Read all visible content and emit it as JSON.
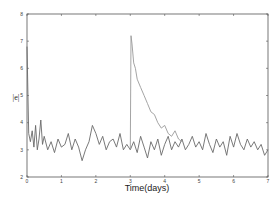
{
  "chart_data": {
    "type": "line",
    "title": "",
    "xlabel": "Time(days)",
    "ylabel": "|e|",
    "xlim": [
      0,
      7
    ],
    "ylim": [
      2,
      8
    ],
    "xticks": [
      0,
      1,
      2,
      3,
      4,
      5,
      6,
      7
    ],
    "yticks": [
      2,
      3,
      4,
      5,
      6,
      7,
      8
    ],
    "grid": false,
    "legend": null,
    "colors": {
      "line": "#6a6a6a",
      "spike": "#9a9a9a",
      "axis": "#555555"
    },
    "series": [
      {
        "name": "baseline noise",
        "description": "noisy signal fluctuating around |e|≈3.2 across 0–7 days, initial spike near 6.8 at t≈0",
        "x": [
          0.0,
          0.05,
          0.1,
          0.15,
          0.2,
          0.25,
          0.3,
          0.35,
          0.4,
          0.45,
          0.5,
          0.6,
          0.7,
          0.8,
          0.9,
          1.0,
          1.1,
          1.2,
          1.3,
          1.4,
          1.5,
          1.6,
          1.7,
          1.8,
          1.9,
          2.0,
          2.1,
          2.2,
          2.3,
          2.4,
          2.5,
          2.6,
          2.7,
          2.8,
          2.9,
          3.0,
          3.1,
          3.2,
          3.3,
          3.4,
          3.5,
          3.6,
          3.7,
          3.8,
          3.9,
          4.0,
          4.1,
          4.2,
          4.3,
          4.4,
          4.5,
          4.6,
          4.7,
          4.8,
          4.9,
          5.0,
          5.1,
          5.2,
          5.3,
          5.4,
          5.5,
          5.6,
          5.7,
          5.8,
          5.9,
          6.0,
          6.1,
          6.2,
          6.3,
          6.4,
          6.5,
          6.6,
          6.7,
          6.8,
          6.9,
          7.0
        ],
        "values": [
          6.8,
          3.6,
          3.3,
          3.7,
          3.1,
          3.9,
          3.0,
          3.4,
          4.1,
          3.2,
          3.5,
          3.0,
          3.3,
          2.9,
          3.4,
          3.1,
          3.2,
          3.6,
          3.0,
          3.4,
          3.1,
          2.6,
          3.0,
          3.3,
          3.9,
          3.6,
          3.2,
          3.5,
          3.0,
          3.3,
          3.4,
          3.1,
          3.6,
          3.0,
          3.2,
          3.0,
          3.3,
          2.9,
          3.5,
          3.1,
          2.7,
          3.3,
          3.0,
          3.4,
          2.8,
          3.2,
          3.5,
          3.0,
          3.3,
          3.1,
          3.4,
          3.0,
          3.2,
          3.5,
          3.1,
          3.3,
          3.0,
          3.6,
          3.2,
          2.9,
          3.4,
          3.1,
          3.3,
          2.8,
          3.5,
          3.1,
          3.6,
          3.2,
          3.0,
          3.4,
          3.1,
          3.3,
          3.0,
          3.2,
          2.8,
          3.0
        ]
      },
      {
        "name": "event response",
        "description": "sharp spike to ~7.2 at t≈3 days followed by decay back to ~3.2 by t≈4.5",
        "x": [
          3.0,
          3.02,
          3.05,
          3.1,
          3.15,
          3.2,
          3.3,
          3.4,
          3.5,
          3.6,
          3.7,
          3.8,
          3.9,
          4.0,
          4.1,
          4.2,
          4.3,
          4.4,
          4.5
        ],
        "values": [
          3.0,
          7.2,
          6.9,
          6.2,
          6.0,
          5.6,
          5.3,
          5.0,
          4.7,
          4.4,
          4.3,
          4.0,
          3.8,
          3.9,
          3.6,
          3.5,
          3.7,
          3.4,
          3.3
        ]
      }
    ]
  }
}
